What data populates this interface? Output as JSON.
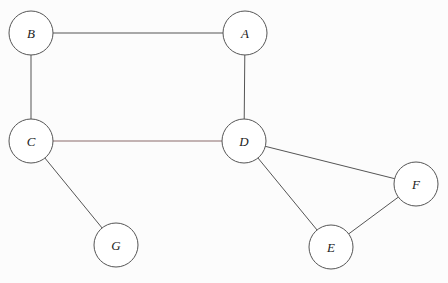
{
  "graph": {
    "nodes": [
      {
        "id": "A",
        "label": "A",
        "x": 245,
        "y": 33
      },
      {
        "id": "B",
        "label": "B",
        "x": 31,
        "y": 33
      },
      {
        "id": "C",
        "label": "C",
        "x": 31,
        "y": 141
      },
      {
        "id": "D",
        "label": "D",
        "x": 244,
        "y": 141
      },
      {
        "id": "E",
        "label": "E",
        "x": 331,
        "y": 247
      },
      {
        "id": "F",
        "label": "F",
        "x": 416,
        "y": 184
      },
      {
        "id": "G",
        "label": "G",
        "x": 116,
        "y": 245
      }
    ],
    "edges": [
      {
        "from": "B",
        "to": "A",
        "color": "#555555"
      },
      {
        "from": "B",
        "to": "C",
        "color": "#555555"
      },
      {
        "from": "A",
        "to": "D",
        "color": "#555555"
      },
      {
        "from": "C",
        "to": "D",
        "color": "#8a6a6a"
      },
      {
        "from": "C",
        "to": "G",
        "color": "#555555"
      },
      {
        "from": "D",
        "to": "F",
        "color": "#555555"
      },
      {
        "from": "D",
        "to": "E",
        "color": "#555555"
      },
      {
        "from": "E",
        "to": "F",
        "color": "#555555"
      }
    ],
    "node_radius": 22
  }
}
